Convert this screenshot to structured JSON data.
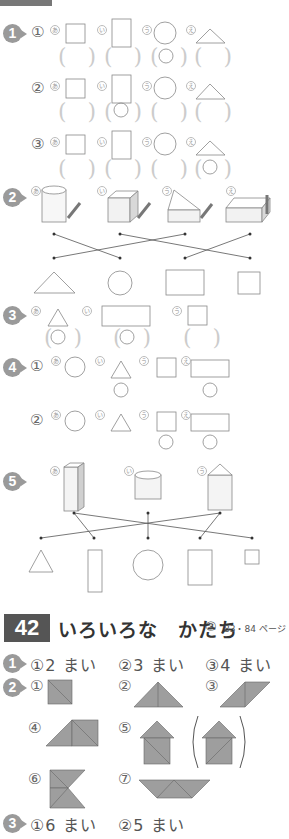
{
  "top_section": {
    "q1": {
      "badge": "1",
      "rows": [
        {
          "num": "①",
          "labels": [
            "あ",
            "い",
            "う",
            "え"
          ],
          "answers": [
            "",
            "",
            "○",
            ""
          ]
        },
        {
          "num": "②",
          "labels": [
            "あ",
            "い",
            "う",
            "え"
          ],
          "answers": [
            "",
            "○",
            "",
            ""
          ]
        },
        {
          "num": "③",
          "labels": [
            "あ",
            "い",
            "う",
            "え"
          ],
          "answers": [
            "",
            "",
            "",
            "○"
          ]
        }
      ]
    },
    "q2": {
      "badge": "2",
      "labels": [
        "あ",
        "い",
        "う",
        "え"
      ],
      "bottom_shapes": [
        "triangle",
        "circle",
        "rectangle",
        "square"
      ]
    },
    "q3": {
      "badge": "3",
      "labels": [
        "あ",
        "い",
        "う"
      ],
      "answers": [
        "○",
        "○",
        ""
      ]
    },
    "q4": {
      "badge": "4",
      "rows": [
        {
          "num": "①",
          "labels": [
            "あ",
            "い",
            "う",
            "え"
          ],
          "answers": [
            "",
            "○",
            "",
            "○"
          ]
        },
        {
          "num": "②",
          "labels": [
            "あ",
            "い",
            "う",
            "え"
          ],
          "answers": [
            "",
            "",
            "○",
            "○"
          ]
        }
      ]
    },
    "q5": {
      "badge": "5",
      "labels": [
        "あ",
        "い",
        "う"
      ],
      "bottom_shapes": [
        "triangle",
        "tall-rectangle",
        "circle",
        "rectangle",
        "small-square"
      ]
    }
  },
  "section42": {
    "number": "42",
    "title": "いろいろな　かたち",
    "sub": "③",
    "pages": "83・84 ページ",
    "q1": {
      "badge": "1",
      "answers": [
        "①2 まい",
        "②3 まい",
        "③4 まい"
      ]
    },
    "q2": {
      "badge": "2",
      "items": [
        "①",
        "②",
        "③",
        "④",
        "⑤",
        "⑥",
        "⑦"
      ]
    },
    "q3": {
      "badge": "3",
      "answers": [
        "①6 まい",
        "②5 まい"
      ]
    }
  },
  "colors": {
    "badge": "#9a9a9a",
    "header_bg": "#555555",
    "tile_fill": "#9e9e9e",
    "line": "#888888"
  }
}
